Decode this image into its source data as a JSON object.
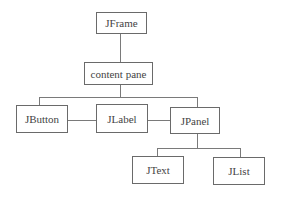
{
  "diagram": {
    "type": "component hierarchy tree",
    "nodes": {
      "jframe": "JFrame",
      "content_pane": "content pane",
      "jbutton": "JButton",
      "jlabel": "JLabel",
      "jpanel": "JPanel",
      "jtext": "JText",
      "jlist": "JList"
    },
    "edges": [
      [
        "JFrame",
        "content pane"
      ],
      [
        "content pane",
        "JButton"
      ],
      [
        "content pane",
        "JLabel"
      ],
      [
        "content pane",
        "JPanel"
      ],
      [
        "JPanel",
        "JText"
      ],
      [
        "JPanel",
        "JList"
      ]
    ]
  }
}
